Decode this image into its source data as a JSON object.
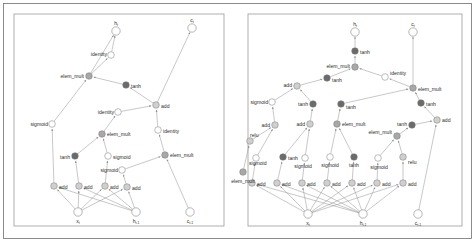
{
  "figure": {
    "title": "",
    "background_color": "#ffffff",
    "panel_border_color": "#8d8d8d",
    "edge_color": "#9a9a9a",
    "node_colors": {
      "white": "#ffffff",
      "light_gray": "#cfcfcf",
      "mid_gray": "#a8a8a8",
      "dark_gray": "#6b6b6b",
      "stroke": "#7a7a7a"
    }
  },
  "panels": [
    {
      "name": "left-graph",
      "x": 14,
      "y": 14,
      "width": 210,
      "height": 212,
      "io_nodes": [
        {
          "id": "L_ht",
          "label": "h_t",
          "label_text": "h",
          "sub": "t",
          "x": 116,
          "y": 31,
          "fill": "white"
        },
        {
          "id": "L_ct",
          "label": "c_t",
          "label_text": "c",
          "sub": "t",
          "x": 192,
          "y": 28,
          "fill": "white"
        },
        {
          "id": "L_xt",
          "label": "x_t",
          "label_text": "x",
          "sub": "t",
          "x": 78,
          "y": 212,
          "fill": "white"
        },
        {
          "id": "L_htm1",
          "label": "h_t-1",
          "label_text": "h",
          "sub": "t-1",
          "x": 136,
          "y": 212,
          "fill": "white"
        },
        {
          "id": "L_ctm1",
          "label": "c_t-1",
          "label_text": "c",
          "sub": "t-1",
          "x": 190,
          "y": 212,
          "fill": "white"
        }
      ],
      "op_nodes": [
        {
          "id": "L_identity_top",
          "label": "identity",
          "x": 111,
          "y": 55,
          "fill": "white",
          "anchor": "end",
          "lx": 107,
          "ly": 54
        },
        {
          "id": "L_elem_mult_top",
          "label": "elem_mult",
          "x": 89,
          "y": 76,
          "fill": "mid_gray",
          "anchor": "end",
          "lx": 84,
          "ly": 76
        },
        {
          "id": "L_tanh_top",
          "label": "tanh",
          "x": 126,
          "y": 85,
          "fill": "dark_gray",
          "anchor": "start",
          "lx": 131,
          "ly": 86
        },
        {
          "id": "L_add_mid",
          "label": "add",
          "x": 156,
          "y": 105,
          "fill": "light_gray",
          "anchor": "start",
          "lx": 161,
          "ly": 106
        },
        {
          "id": "L_identity_mid",
          "label": "identity",
          "x": 118,
          "y": 112,
          "fill": "white",
          "anchor": "end",
          "lx": 114,
          "ly": 112
        },
        {
          "id": "L_sigmoid_left",
          "label": "sigmoid",
          "x": 52,
          "y": 124,
          "fill": "white",
          "anchor": "end",
          "lx": 48,
          "ly": 124
        },
        {
          "id": "L_identity_right",
          "label": "identity",
          "x": 158,
          "y": 130,
          "fill": "white",
          "anchor": "start",
          "lx": 163,
          "ly": 131
        },
        {
          "id": "L_elem_mult_2",
          "label": "elem_mult",
          "x": 102,
          "y": 134,
          "fill": "mid_gray",
          "anchor": "start",
          "lx": 107,
          "ly": 134
        },
        {
          "id": "L_elem_mult_3",
          "label": "elem_mult",
          "x": 165,
          "y": 155,
          "fill": "mid_gray",
          "anchor": "start",
          "lx": 170,
          "ly": 155
        },
        {
          "id": "L_tanh_low",
          "label": "tanh",
          "x": 75,
          "y": 156,
          "fill": "dark_gray",
          "anchor": "end",
          "lx": 70,
          "ly": 157
        },
        {
          "id": "L_sigmoid_mid",
          "label": "sigmoid",
          "x": 108,
          "y": 156,
          "fill": "white",
          "anchor": "start",
          "lx": 113,
          "ly": 157
        },
        {
          "id": "L_sigmoid_low",
          "label": "sigmoid",
          "x": 122,
          "y": 170,
          "fill": "white",
          "anchor": "end",
          "lx": 118,
          "ly": 170
        },
        {
          "id": "L_add_1",
          "label": "add",
          "x": 54,
          "y": 186,
          "fill": "light_gray",
          "anchor": "start",
          "lx": 59,
          "ly": 187
        },
        {
          "id": "L_add_2",
          "label": "add",
          "x": 79,
          "y": 186,
          "fill": "light_gray",
          "anchor": "start",
          "lx": 84,
          "ly": 187
        },
        {
          "id": "L_add_3",
          "label": "add",
          "x": 105,
          "y": 186,
          "fill": "light_gray",
          "anchor": "start",
          "lx": 110,
          "ly": 187
        },
        {
          "id": "L_add_4",
          "label": "add",
          "x": 127,
          "y": 187,
          "fill": "light_gray",
          "anchor": "start",
          "lx": 132,
          "ly": 188
        }
      ],
      "edges": [
        [
          "L_identity_top",
          "L_ht"
        ],
        [
          "L_elem_mult_top",
          "L_identity_top"
        ],
        [
          "L_elem_mult_top",
          "L_ht"
        ],
        [
          "L_tanh_top",
          "L_elem_mult_top"
        ],
        [
          "L_add_mid",
          "L_tanh_top"
        ],
        [
          "L_add_mid",
          "L_ct"
        ],
        [
          "L_identity_mid",
          "L_add_mid"
        ],
        [
          "L_identity_right",
          "L_add_mid"
        ],
        [
          "L_elem_mult_2",
          "L_identity_mid"
        ],
        [
          "L_elem_mult_3",
          "L_identity_right"
        ],
        [
          "L_tanh_low",
          "L_elem_mult_2"
        ],
        [
          "L_sigmoid_mid",
          "L_elem_mult_2"
        ],
        [
          "L_sigmoid_low",
          "L_elem_mult_3"
        ],
        [
          "L_ctm1",
          "L_elem_mult_3"
        ],
        [
          "L_add_1",
          "L_sigmoid_left"
        ],
        [
          "L_sigmoid_left",
          "L_elem_mult_top"
        ],
        [
          "L_add_2",
          "L_tanh_low"
        ],
        [
          "L_add_3",
          "L_sigmoid_mid"
        ],
        [
          "L_add_4",
          "L_sigmoid_low"
        ],
        [
          "L_xt",
          "L_add_1"
        ],
        [
          "L_xt",
          "L_add_2"
        ],
        [
          "L_xt",
          "L_add_3"
        ],
        [
          "L_xt",
          "L_add_4"
        ],
        [
          "L_htm1",
          "L_add_1"
        ],
        [
          "L_htm1",
          "L_add_2"
        ],
        [
          "L_htm1",
          "L_add_3"
        ],
        [
          "L_htm1",
          "L_add_4"
        ]
      ]
    },
    {
      "name": "right-graph",
      "x": 248,
      "y": 14,
      "width": 214,
      "height": 212,
      "io_nodes": [
        {
          "id": "R_ht",
          "label": "h_t",
          "label_text": "h",
          "sub": "t",
          "x": 355,
          "y": 32,
          "fill": "white"
        },
        {
          "id": "R_ct",
          "label": "c_t",
          "label_text": "c",
          "sub": "t",
          "x": 413,
          "y": 32,
          "fill": "white"
        },
        {
          "id": "R_xt",
          "label": "x_t",
          "label_text": "x",
          "sub": "t",
          "x": 308,
          "y": 214,
          "fill": "white"
        },
        {
          "id": "R_htm1",
          "label": "h_t-1",
          "label_text": "h",
          "sub": "t-1",
          "x": 363,
          "y": 214,
          "fill": "white"
        },
        {
          "id": "R_ctm1",
          "label": "c_t-1",
          "label_text": "c",
          "sub": "t-1",
          "x": 418,
          "y": 214,
          "fill": "white"
        }
      ],
      "op_nodes": [
        {
          "id": "R_tanh_top",
          "label": "tanh",
          "x": 355,
          "y": 51,
          "fill": "dark_gray",
          "anchor": "start",
          "lx": 360,
          "ly": 52
        },
        {
          "id": "R_elem_mult_top",
          "label": "elem_mult",
          "x": 355,
          "y": 67,
          "fill": "mid_gray",
          "anchor": "end",
          "lx": 350,
          "ly": 66
        },
        {
          "id": "R_identity",
          "label": "identity",
          "x": 385,
          "y": 77,
          "fill": "white",
          "anchor": "start",
          "lx": 390,
          "ly": 73
        },
        {
          "id": "R_tanh_2",
          "label": "tanh",
          "x": 327,
          "y": 78,
          "fill": "dark_gray",
          "anchor": "start",
          "lx": 332,
          "ly": 80
        },
        {
          "id": "R_add_top",
          "label": "add",
          "x": 297,
          "y": 86,
          "fill": "light_gray",
          "anchor": "end",
          "lx": 292,
          "ly": 85
        },
        {
          "id": "R_elem_mult_right",
          "label": "elem_mult",
          "x": 413,
          "y": 88,
          "fill": "mid_gray",
          "anchor": "start",
          "lx": 418,
          "ly": 89
        },
        {
          "id": "R_sigmoid_far_left",
          "label": "sigmoid",
          "x": 272,
          "y": 102,
          "fill": "white",
          "anchor": "end",
          "lx": 268,
          "ly": 102
        },
        {
          "id": "R_tanh_3",
          "label": "tanh",
          "x": 313,
          "y": 104,
          "fill": "dark_gray",
          "anchor": "end",
          "lx": 308,
          "ly": 104
        },
        {
          "id": "R_tanh_4",
          "label": "tanh",
          "x": 341,
          "y": 104,
          "fill": "dark_gray",
          "anchor": "start",
          "lx": 346,
          "ly": 107
        },
        {
          "id": "R_tanh_5",
          "label": "tanh",
          "x": 421,
          "y": 103,
          "fill": "dark_gray",
          "anchor": "start",
          "lx": 426,
          "ly": 104
        },
        {
          "id": "R_add_l1",
          "label": "add",
          "x": 275,
          "y": 125,
          "fill": "light_gray",
          "anchor": "end",
          "lx": 270,
          "ly": 125
        },
        {
          "id": "R_add_l2",
          "label": "add",
          "x": 310,
          "y": 124,
          "fill": "light_gray",
          "anchor": "end",
          "lx": 305,
          "ly": 124
        },
        {
          "id": "R_elem_mult_mid",
          "label": "elem_mult",
          "x": 337,
          "y": 124,
          "fill": "mid_gray",
          "anchor": "start",
          "lx": 342,
          "ly": 124
        },
        {
          "id": "R_tanh_6",
          "label": "tanh",
          "x": 412,
          "y": 125,
          "fill": "dark_gray",
          "anchor": "end",
          "lx": 407,
          "ly": 124
        },
        {
          "id": "R_add_r1",
          "label": "add",
          "x": 437,
          "y": 120,
          "fill": "light_gray",
          "anchor": "start",
          "lx": 442,
          "ly": 120
        },
        {
          "id": "R_elem_mult_low",
          "label": "elem_mult",
          "x": 397,
          "y": 136,
          "fill": "mid_gray",
          "anchor": "end",
          "lx": 392,
          "ly": 132
        },
        {
          "id": "R_relu_left",
          "label": "relu",
          "x": 250,
          "y": 141,
          "fill": "light_gray",
          "anchor": "start",
          "lx": 250,
          "ly": 135
        },
        {
          "id": "R_sigmoid_1",
          "label": "sigmoid",
          "x": 256,
          "y": 158,
          "fill": "white",
          "anchor": "start",
          "lx": 249,
          "ly": 163
        },
        {
          "id": "R_tanh_7",
          "label": "tanh",
          "x": 283,
          "y": 157,
          "fill": "dark_gray",
          "anchor": "start",
          "lx": 288,
          "ly": 158
        },
        {
          "id": "R_sigmoid_2",
          "label": "sigmoid",
          "x": 305,
          "y": 158,
          "fill": "white",
          "anchor": "middle",
          "lx": 303,
          "ly": 166
        },
        {
          "id": "R_sigmoid_3",
          "label": "sigmoid",
          "x": 330,
          "y": 157,
          "fill": "white",
          "anchor": "middle",
          "lx": 330,
          "ly": 165
        },
        {
          "id": "R_tanh_8",
          "label": "tanh",
          "x": 354,
          "y": 157,
          "fill": "dark_gray",
          "anchor": "middle",
          "lx": 354,
          "ly": 165
        },
        {
          "id": "R_sigmoid_4",
          "label": "sigmoid",
          "x": 378,
          "y": 158,
          "fill": "white",
          "anchor": "middle",
          "lx": 379,
          "ly": 167
        },
        {
          "id": "R_relu_right",
          "label": "relu",
          "x": 403,
          "y": 157,
          "fill": "light_gray",
          "anchor": "start",
          "lx": 408,
          "ly": 162
        },
        {
          "id": "R_add_1",
          "label": "add",
          "x": 252,
          "y": 183,
          "fill": "light_gray",
          "anchor": "start",
          "lx": 257,
          "ly": 184
        },
        {
          "id": "R_add_2",
          "label": "add",
          "x": 277,
          "y": 183,
          "fill": "light_gray",
          "anchor": "start",
          "lx": 282,
          "ly": 184
        },
        {
          "id": "R_add_3",
          "label": "add",
          "x": 302,
          "y": 183,
          "fill": "light_gray",
          "anchor": "start",
          "lx": 307,
          "ly": 184
        },
        {
          "id": "R_add_4",
          "label": "add",
          "x": 327,
          "y": 183,
          "fill": "light_gray",
          "anchor": "start",
          "lx": 332,
          "ly": 184
        },
        {
          "id": "R_add_5",
          "label": "add",
          "x": 352,
          "y": 183,
          "fill": "light_gray",
          "anchor": "start",
          "lx": 357,
          "ly": 184
        },
        {
          "id": "R_add_6",
          "label": "add",
          "x": 377,
          "y": 183,
          "fill": "light_gray",
          "anchor": "start",
          "lx": 382,
          "ly": 184
        },
        {
          "id": "R_add_7",
          "label": "add",
          "x": 403,
          "y": 183,
          "fill": "light_gray",
          "anchor": "start",
          "lx": 408,
          "ly": 184
        },
        {
          "id": "R_elem_mult_far_left",
          "label": "elem_mult",
          "x": 243,
          "y": 172,
          "fill": "mid_gray",
          "anchor": "middle",
          "lx": 243,
          "ly": 181
        }
      ],
      "edges": [
        [
          "R_tanh_top",
          "R_ht"
        ],
        [
          "R_elem_mult_top",
          "R_tanh_top"
        ],
        [
          "R_tanh_2",
          "R_elem_mult_top"
        ],
        [
          "R_identity",
          "R_elem_mult_top"
        ],
        [
          "R_add_top",
          "R_tanh_2"
        ],
        [
          "R_elem_mult_right",
          "R_identity"
        ],
        [
          "R_elem_mult_right",
          "R_ct"
        ],
        [
          "R_sigmoid_far_left",
          "R_add_top"
        ],
        [
          "R_tanh_3",
          "R_add_top"
        ],
        [
          "R_tanh_4",
          "R_elem_mult_right"
        ],
        [
          "R_tanh_5",
          "R_elem_mult_right"
        ],
        [
          "R_add_l1",
          "R_sigmoid_far_left"
        ],
        [
          "R_add_l2",
          "R_tanh_3"
        ],
        [
          "R_elem_mult_mid",
          "R_tanh_4"
        ],
        [
          "R_tanh_6",
          "R_add_r1"
        ],
        [
          "R_add_r1",
          "R_tanh_5"
        ],
        [
          "R_elem_mult_low",
          "R_tanh_6"
        ],
        [
          "R_relu_left",
          "R_add_l1"
        ],
        [
          "R_sigmoid_1",
          "R_add_l1"
        ],
        [
          "R_tanh_7",
          "R_add_l2"
        ],
        [
          "R_sigmoid_2",
          "R_add_l2"
        ],
        [
          "R_sigmoid_3",
          "R_elem_mult_mid"
        ],
        [
          "R_tanh_8",
          "R_elem_mult_mid"
        ],
        [
          "R_sigmoid_4",
          "R_elem_mult_low"
        ],
        [
          "R_relu_right",
          "R_elem_mult_low"
        ],
        [
          "R_add_1",
          "R_sigmoid_1"
        ],
        [
          "R_add_2",
          "R_tanh_7"
        ],
        [
          "R_add_3",
          "R_sigmoid_2"
        ],
        [
          "R_add_4",
          "R_sigmoid_3"
        ],
        [
          "R_add_5",
          "R_tanh_8"
        ],
        [
          "R_add_6",
          "R_sigmoid_4"
        ],
        [
          "R_add_7",
          "R_relu_right"
        ],
        [
          "R_ctm1",
          "R_add_r1"
        ],
        [
          "R_xt",
          "R_add_1"
        ],
        [
          "R_xt",
          "R_add_2"
        ],
        [
          "R_xt",
          "R_add_3"
        ],
        [
          "R_xt",
          "R_add_4"
        ],
        [
          "R_xt",
          "R_add_5"
        ],
        [
          "R_xt",
          "R_add_6"
        ],
        [
          "R_xt",
          "R_add_7"
        ],
        [
          "R_htm1",
          "R_add_1"
        ],
        [
          "R_htm1",
          "R_add_2"
        ],
        [
          "R_htm1",
          "R_add_3"
        ],
        [
          "R_htm1",
          "R_add_4"
        ],
        [
          "R_htm1",
          "R_add_5"
        ],
        [
          "R_htm1",
          "R_add_6"
        ],
        [
          "R_htm1",
          "R_add_7"
        ],
        [
          "R_elem_mult_far_left",
          "R_relu_left"
        ]
      ]
    }
  ],
  "legend": {
    "operations": [
      "identity",
      "elem_mult",
      "tanh",
      "sigmoid",
      "add",
      "relu"
    ]
  }
}
